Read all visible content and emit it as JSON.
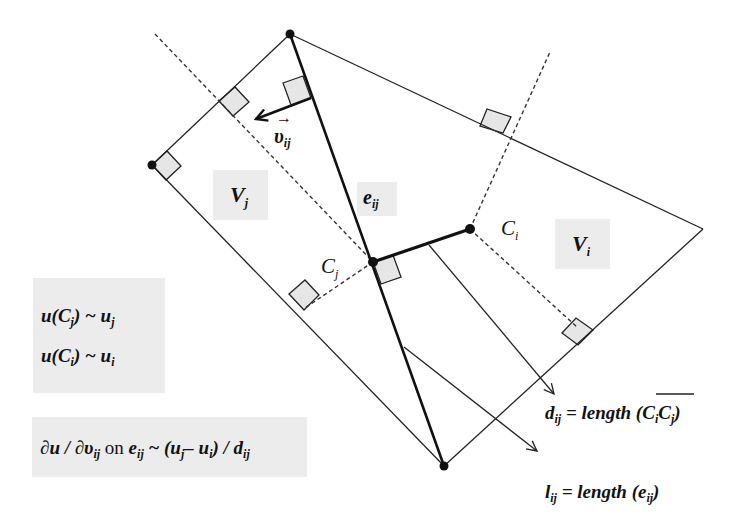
{
  "diagram": {
    "vertices": {
      "top": [
        290,
        34
      ],
      "left": [
        152,
        165
      ],
      "bottom": [
        444,
        466
      ],
      "right": [
        703,
        229
      ]
    },
    "centers": {
      "Cj": [
        373,
        262
      ],
      "Ci": [
        470,
        229
      ]
    },
    "labels": {
      "v_ij": {
        "main": "υ",
        "sub": "ij",
        "accent": "→"
      },
      "e_ij": {
        "main": "e",
        "sub": "ij"
      },
      "V_j": {
        "main": "V",
        "sub": "j"
      },
      "V_i": {
        "main": "V",
        "sub": "i"
      },
      "C_j": {
        "main": "C",
        "sub": "j"
      },
      "C_i": {
        "main": "C",
        "sub": "i"
      }
    },
    "equations": {
      "box1": {
        "line1": {
          "a": "u(C",
          "sub": "j",
          "b": ") ~ u",
          "sub2": "j"
        },
        "line2": {
          "a": "u(C",
          "sub": "i",
          "b": ") ~ u",
          "sub2": "i"
        }
      },
      "box2": {
        "p1": "∂u / ∂υ",
        "s1": "ij",
        "p2": " on ",
        "p3": "e",
        "s3": "ij",
        "p4": " ~ (u",
        "s4": "j",
        "p5": "– u",
        "s5": "i",
        "p6": ") / d",
        "s6": "ij"
      },
      "d_def": {
        "p1": "d",
        "s1": "ij",
        "p2": " = length (",
        "p3": "C",
        "s3": "i",
        "p4": "C",
        "s4": "j",
        "p5": ")"
      },
      "l_def": {
        "p1": "l",
        "s1": "ij",
        "p2": " = length (e",
        "s2": "ij",
        "p3": ")"
      }
    },
    "colors": {
      "line": "#222222",
      "marker_fill": "#e6e6e6",
      "label_bg": "#ececec"
    }
  }
}
